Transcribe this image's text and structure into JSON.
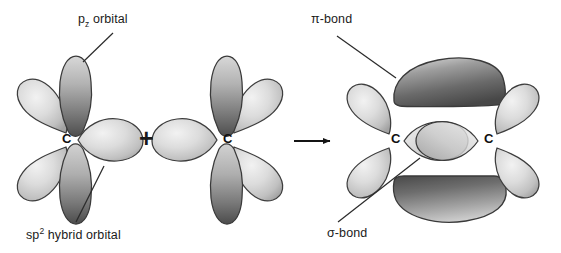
{
  "diagram": {
    "type": "orbital-overlap-diagram",
    "background_color": "#ffffff",
    "ink_color": "#1b1b1b"
  },
  "labels": {
    "pz_orbital": "p",
    "pz_subscript": "z",
    "pz_orbital_tail": " orbital",
    "sp2_prefix": "sp",
    "sp2_superscript": "2",
    "sp2_tail": " hybrid orbital",
    "pi_bond": "π-bond",
    "sigma_bond": "σ-bond"
  },
  "operators": {
    "plus": "+",
    "arrow": "→"
  },
  "atoms": {
    "carbon_symbol": "C",
    "left_reactant_label": "C",
    "right_reactant_label": "C",
    "product_left_label": "C",
    "product_right_label": "C"
  },
  "colors": {
    "sp2_lobe_light": "#e4e4e4",
    "sp2_lobe_mid": "#b9b9b9",
    "sp2_lobe_dark": "#8e8e8e",
    "pz_lobe_light": "#cfcfcf",
    "pz_lobe_dark": "#555555",
    "pi_lobe_light": "#c8c8c8",
    "pi_lobe_dark": "#4a4a4a",
    "outline": "#3a3a3a",
    "leader_line": "#2b2b2b"
  },
  "structures": {
    "reactant_left": {
      "name": "sp2 hybridized carbon atom (left)",
      "sp2_lobe_count": 3,
      "pz_lobe_count": 2
    },
    "reactant_right": {
      "name": "sp2 hybridized carbon atom (right)",
      "sp2_lobe_count": 3,
      "pz_lobe_count": 2
    },
    "product": {
      "name": "ethylene-like C=C double bond",
      "sigma_bond_lobes": 2,
      "pi_bond_lobes": 2,
      "terminal_sp2_lobes": 4
    }
  }
}
